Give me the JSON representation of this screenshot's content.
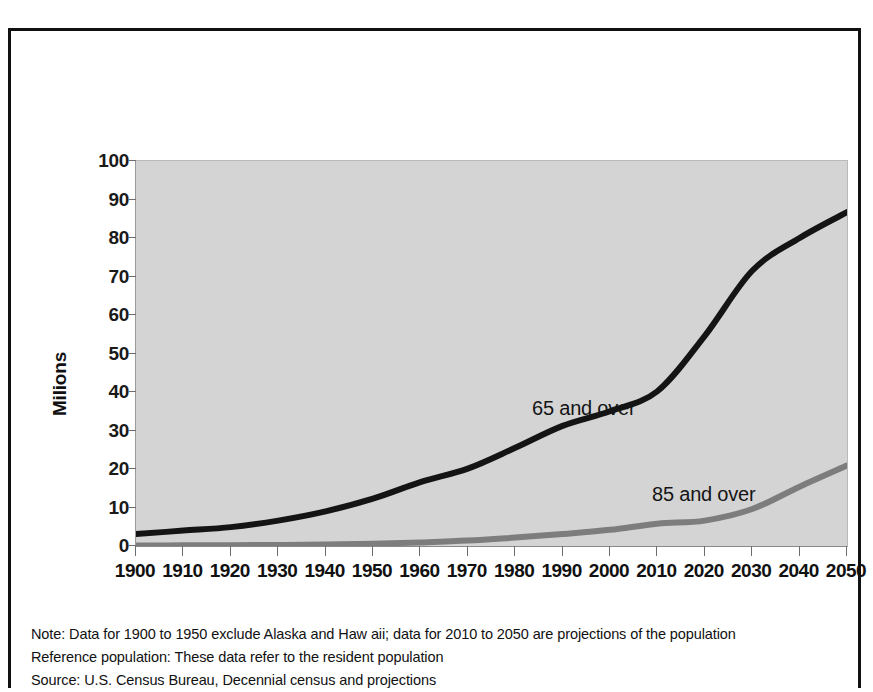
{
  "chart_data": {
    "type": "line",
    "title": "",
    "xlabel": "",
    "ylabel": "Milions",
    "xlim": [
      1900,
      2050
    ],
    "ylim": [
      0,
      100
    ],
    "grid": false,
    "legend_position": "inline-annotation",
    "x": [
      1900,
      1910,
      1920,
      1930,
      1940,
      1950,
      1960,
      1970,
      1980,
      1990,
      2000,
      2010,
      2020,
      2030,
      2040,
      2050
    ],
    "xtick_labels": [
      "1900",
      "1910",
      "1920",
      "1930",
      "1940",
      "1950",
      "1960",
      "1970",
      "1980",
      "1990",
      "2000",
      "2010",
      "2020",
      "2030",
      "2040",
      "2050"
    ],
    "ytick_labels": [
      "100",
      "90",
      "80",
      "70",
      "60",
      "50",
      "40",
      "30",
      "20",
      "10",
      "0"
    ],
    "ytick_values": [
      100,
      90,
      80,
      70,
      60,
      50,
      40,
      30,
      20,
      10,
      0
    ],
    "series": [
      {
        "name": "65 and over",
        "color": "#141414",
        "values": [
          3.1,
          4.0,
          4.9,
          6.6,
          9.0,
          12.3,
          16.6,
          20.1,
          25.5,
          31.2,
          35.0,
          40.2,
          54.6,
          71.5,
          80.0,
          86.7
        ]
      },
      {
        "name": "85 and over",
        "color": "#7d7d7d",
        "values": [
          0.12,
          0.17,
          0.21,
          0.27,
          0.37,
          0.58,
          0.93,
          1.4,
          2.2,
          3.1,
          4.2,
          5.8,
          6.6,
          9.6,
          15.4,
          20.9
        ]
      }
    ],
    "annotations": [
      {
        "text": "65 and over",
        "x": 1986,
        "y": 42
      },
      {
        "text": "85 and over",
        "x": 2011,
        "y": 19
      }
    ]
  },
  "footnotes": [
    "Note: Data for 1900 to 1950 exclude Alaska and Haw aii; data for 2010 to 2050 are projections of the population",
    "Reference population: These data refer to the resident population",
    "Source: U.S. Census Bureau, Decennial census and projections"
  ],
  "colors": {
    "plot_background": "#d4d4d4",
    "frame_border": "#111111",
    "series_65": "#141414",
    "series_85": "#7d7d7d",
    "text": "#111111"
  }
}
